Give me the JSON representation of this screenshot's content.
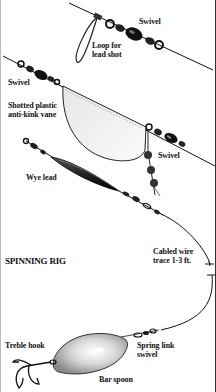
{
  "title": "SPINNING RIG",
  "labels": {
    "swivel_top": "Swivel",
    "loop": "Loop for\nlead shot",
    "swivel_left": "Swivel",
    "vane": "Shotted plastic\nanti-kink vane",
    "swivel_right": "Swivel",
    "wye_lead": "Wye lead",
    "wire_trace": "Cabled wire\ntrace 1-3 ft.",
    "treble_hook": "Treble hook",
    "spring_link": "Spring link\nswivel",
    "bar_spoon": "Bar spoon"
  },
  "colors": {
    "ink": "#111111",
    "vane_fill": "#f2f2f2",
    "spoon_fill": "#cfcfcf",
    "background": "#ffffff"
  }
}
